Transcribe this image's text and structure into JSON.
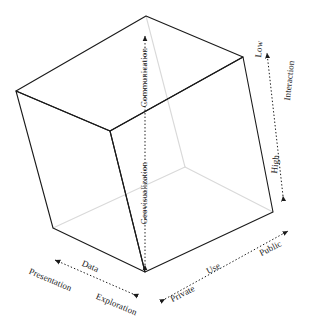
{
  "figure": {
    "type": "diagram",
    "background_color": "#ffffff",
    "edge_color_visible": "#1a1a1a",
    "edge_color_hidden": "#d8d8d8",
    "axis_color": "#1a1a1a"
  },
  "axes": [
    {
      "id": "vertical",
      "name": "vertical-axis",
      "top_label": "Communication",
      "bottom_label": "Geovisualization",
      "style": "dotted-double-arrow"
    },
    {
      "id": "depth-right",
      "name": "interaction-axis",
      "title": "Interaction",
      "start_label": "Low",
      "end_label": "High",
      "style": "dotted-double-arrow"
    },
    {
      "id": "bottom-left",
      "name": "data-axis",
      "title": "Data",
      "start_label": "Presentation",
      "end_label": "Exploration",
      "style": "dotted-double-arrow"
    },
    {
      "id": "bottom-right",
      "name": "use-axis",
      "title": "Use",
      "start_label": "Private",
      "end_label": "Public",
      "style": "dotted-double-arrow"
    }
  ],
  "labels": {
    "communication": "Communication",
    "geovisualization": "Geovisualization",
    "low": "Low",
    "interaction": "Interaction",
    "high": "High",
    "presentation": "Presentation",
    "data": "Data",
    "exploration": "Exploration",
    "private": "Private",
    "use": "Use",
    "public": "Public"
  },
  "geometry": {
    "vertices": {
      "top_apex": [
        146,
        16
      ],
      "top_left": [
        16,
        91
      ],
      "top_right": [
        243,
        57
      ],
      "front_top": [
        110,
        131
      ],
      "bottom_left": [
        53,
        228
      ],
      "bottom_right": [
        273,
        212
      ],
      "front_bottom": [
        145,
        272
      ],
      "hidden_back": [
        185,
        167
      ]
    }
  }
}
